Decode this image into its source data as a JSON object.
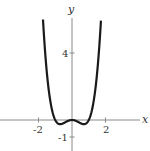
{
  "chart_data": {
    "type": "line",
    "title": "",
    "xlabel": "x",
    "ylabel": "y",
    "function": "y = x^4 - x^2",
    "xlim": [
      -4.3,
      4.1
    ],
    "ylim": [
      -1.8,
      6.0
    ],
    "x_ticks": [
      {
        "value": -2,
        "label": "-2"
      },
      {
        "value": 2,
        "label": "2"
      }
    ],
    "y_ticks": [
      {
        "value": 4,
        "label": "4"
      },
      {
        "value": -1,
        "label": "-1"
      }
    ],
    "grid": false,
    "legend": null,
    "series": [
      {
        "name": "f(x)",
        "x": [
          -1.73,
          -1.5,
          -1.25,
          -1.0,
          -0.71,
          -0.5,
          -0.25,
          0,
          0.25,
          0.5,
          0.71,
          1.0,
          1.25,
          1.5,
          1.73
        ],
        "values": [
          6.0,
          2.81,
          0.88,
          0.0,
          -0.25,
          -0.19,
          -0.06,
          0,
          -0.06,
          -0.19,
          -0.25,
          0.0,
          0.88,
          2.81,
          6.0
        ]
      }
    ],
    "colors": {
      "curve": "#1a1a1a",
      "axes": "#8a8a8a"
    }
  },
  "labels": {
    "x_axis": "x",
    "y_axis": "y",
    "tick_neg2": "-2",
    "tick_2": "2",
    "tick_4": "4",
    "tick_neg1": "-1"
  }
}
